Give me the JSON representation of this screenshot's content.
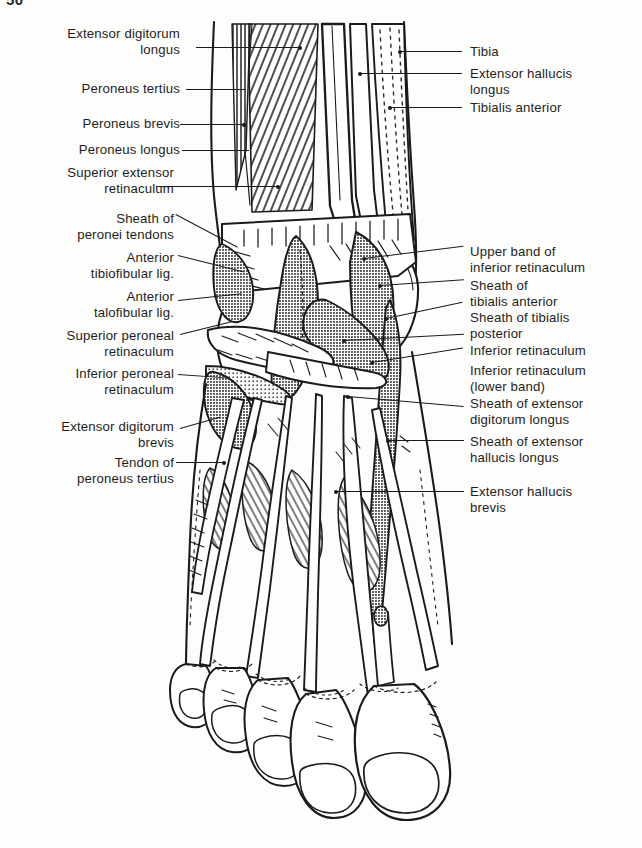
{
  "plate": {
    "page_number": "50",
    "caption": "",
    "subject": "Dorsum of foot and anterior ankle: tendons, sheaths and retinacula"
  },
  "colors": {
    "ink": "#1b1b1b",
    "paper": "#fdfdfc",
    "tone_light": "#cfcfcf",
    "tone_mid": "#a2a2a2",
    "tone_dark": "#6e6e6e"
  },
  "labels_left": [
    {
      "id": "extensor-digitorum-longus",
      "text": "Extensor digitorum\nlongus"
    },
    {
      "id": "peroneus-tertius",
      "text": "Peroneus tertius"
    },
    {
      "id": "peroneus-brevis",
      "text": "Peroneus brevis"
    },
    {
      "id": "peroneus-longus",
      "text": "Peroneus longus"
    },
    {
      "id": "superior-extensor-retinaculum",
      "text": "Superior extensor\nretinaculum"
    },
    {
      "id": "sheath-of-peronei-tendons",
      "text": "Sheath of\nperonei tendons"
    },
    {
      "id": "anterior-tibiofibular-lig",
      "text": "Anterior\ntibiofibular lig."
    },
    {
      "id": "anterior-talofibular-lig",
      "text": "Anterior\ntalofibular lig."
    },
    {
      "id": "superior-peroneal-retinaculum",
      "text": "Superior peroneal\nretinaculum"
    },
    {
      "id": "inferior-peroneal-retinaculum",
      "text": "Inferior peroneal\nretinaculum"
    },
    {
      "id": "extensor-digitorum-brevis",
      "text": "Extensor digitorum\nbrevis"
    },
    {
      "id": "tendon-of-peroneus-tertius",
      "text": "Tendon of\nperoneus tertius"
    }
  ],
  "labels_right": [
    {
      "id": "tibia",
      "text": "Tibia"
    },
    {
      "id": "extensor-hallucis-longus",
      "text": "Extensor hallucis\nlongus"
    },
    {
      "id": "tibialis-anterior",
      "text": "Tibialis anterior"
    },
    {
      "id": "upper-band-of-inferior-retinaculum",
      "text": "Upper band of\ninferior retinaculum"
    },
    {
      "id": "sheath-of-tibialis-anterior",
      "text": "Sheath of\ntibialis anterior"
    },
    {
      "id": "sheath-of-tibialis-posterior",
      "text": "Sheath of tibialis\nposterior"
    },
    {
      "id": "inferior-retinaculum",
      "text": "Inferior retinaculum"
    },
    {
      "id": "inferior-retinaculum-lower-band",
      "text": "Inferior retinaculum\n(lower band)"
    },
    {
      "id": "sheath-of-extensor-digitorum-longus",
      "text": "Sheath of extensor\ndigitorum longus"
    },
    {
      "id": "sheath-of-extensor-hallucis-longus",
      "text": "Sheath of extensor\nhallucis longus"
    },
    {
      "id": "extensor-hallucis-brevis",
      "text": "Extensor hallucis\nbrevis"
    }
  ]
}
